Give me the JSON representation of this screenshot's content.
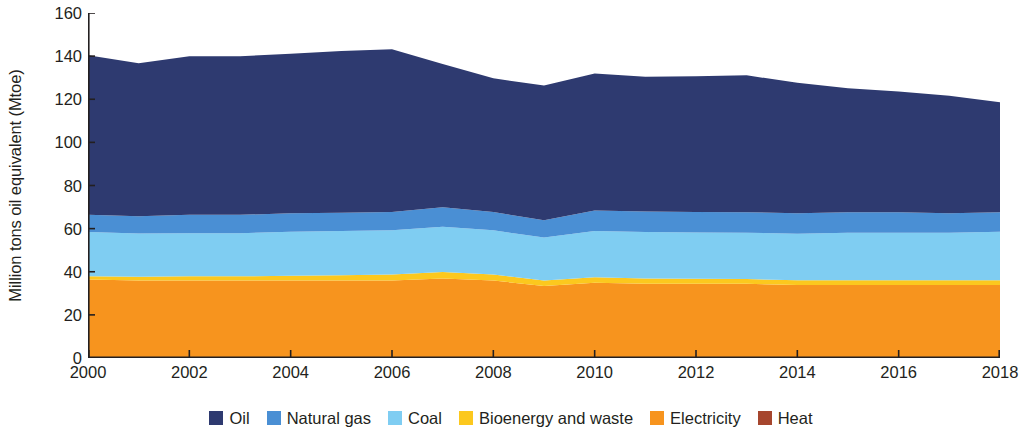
{
  "chart_data": {
    "type": "area",
    "stacked": true,
    "title": "",
    "subtitle": "",
    "xlabel": "",
    "ylabel": "Million tons oil equivalent (Mtoe)",
    "xlim": [
      2000,
      2018
    ],
    "ylim": [
      0,
      160
    ],
    "grid": false,
    "legend_position": "bottom",
    "x": [
      2000,
      2001,
      2002,
      2003,
      2004,
      2005,
      2006,
      2007,
      2008,
      2009,
      2010,
      2011,
      2012,
      2013,
      2014,
      2015,
      2016,
      2017,
      2018
    ],
    "x_tick_labels": [
      "2000",
      "2002",
      "2004",
      "2006",
      "2008",
      "2010",
      "2012",
      "2014",
      "2016",
      "2018"
    ],
    "x_ticks": [
      2000,
      2002,
      2004,
      2006,
      2008,
      2010,
      2012,
      2014,
      2016,
      2018
    ],
    "y_ticks": [
      0,
      20,
      40,
      60,
      80,
      100,
      120,
      140,
      160
    ],
    "y_tick_labels": [
      "0",
      "20",
      "40",
      "60",
      "80",
      "100",
      "120",
      "140",
      "160"
    ],
    "stack_order_bottom_to_top": [
      "Heat",
      "Electricity",
      "Bioenergy and waste",
      "Coal",
      "Natural gas",
      "Oil"
    ],
    "series": [
      {
        "name": "Oil",
        "color": "#2e3a70",
        "values": [
          74.0,
          71.0,
          73.5,
          73.5,
          74.0,
          75.0,
          75.5,
          66.5,
          62.0,
          62.5,
          63.5,
          62.5,
          63.0,
          63.5,
          60.5,
          57.5,
          56.0,
          54.5,
          51.0
        ]
      },
      {
        "name": "Natural gas",
        "color": "#4a8fd4",
        "values": [
          8.0,
          8.0,
          8.5,
          8.5,
          8.5,
          8.5,
          8.5,
          9.0,
          8.5,
          8.0,
          9.5,
          9.5,
          9.5,
          9.5,
          9.5,
          9.5,
          9.5,
          9.0,
          9.0
        ]
      },
      {
        "name": "Coal",
        "color": "#7fcdf2",
        "values": [
          20.5,
          20.0,
          20.0,
          20.0,
          20.5,
          20.5,
          20.5,
          21.0,
          20.5,
          20.0,
          21.5,
          21.5,
          21.5,
          21.5,
          21.5,
          22.0,
          22.0,
          22.0,
          22.5
        ]
      },
      {
        "name": "Bioenergy and waste",
        "color": "#fcc81e",
        "values": [
          1.5,
          1.8,
          2.0,
          2.0,
          2.2,
          2.5,
          2.8,
          3.0,
          2.8,
          2.5,
          2.5,
          2.5,
          2.3,
          2.2,
          2.2,
          2.2,
          2.2,
          2.2,
          2.2
        ]
      },
      {
        "name": "Electricity",
        "color": "#f7941e",
        "values": [
          36.0,
          35.5,
          35.5,
          35.5,
          35.5,
          35.5,
          35.5,
          36.5,
          35.5,
          33.0,
          34.5,
          34.0,
          34.0,
          34.0,
          33.5,
          33.5,
          33.5,
          33.5,
          33.5
        ]
      },
      {
        "name": "Heat",
        "color": "#a6462e",
        "values": [
          0.4,
          0.4,
          0.4,
          0.4,
          0.4,
          0.4,
          0.4,
          0.4,
          0.4,
          0.4,
          0.4,
          0.4,
          0.4,
          0.4,
          0.4,
          0.4,
          0.4,
          0.4,
          0.4
        ]
      }
    ],
    "totals": [
      140.4,
      136.7,
      139.9,
      139.9,
      141.1,
      142.4,
      143.2,
      136.4,
      129.7,
      126.4,
      131.9,
      130.4,
      130.7,
      131.1,
      127.6,
      125.1,
      123.6,
      121.6,
      118.6
    ],
    "annotations": []
  },
  "legend": {
    "items": [
      {
        "label": "Oil",
        "color": "#2e3a70"
      },
      {
        "label": "Natural gas",
        "color": "#4a8fd4"
      },
      {
        "label": "Coal",
        "color": "#7fcdf2"
      },
      {
        "label": "Bioenergy and waste",
        "color": "#fcc81e"
      },
      {
        "label": "Electricity",
        "color": "#f7941e"
      },
      {
        "label": "Heat",
        "color": "#a6462e"
      }
    ]
  },
  "axes": {
    "y_title": "Million tons oil equivalent (Mtoe)",
    "axis_color": "#231f20"
  }
}
